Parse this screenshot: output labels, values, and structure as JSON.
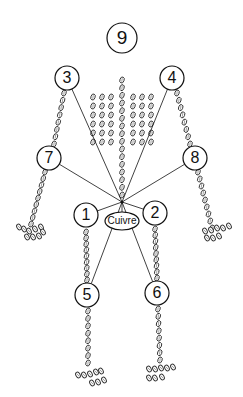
{
  "diagram": {
    "title": "",
    "center_label": "Cuivre",
    "hub": {
      "x": 122,
      "y": 202
    },
    "nodes": [
      {
        "id": "9",
        "label": "9",
        "x": 122,
        "y": 38,
        "r": 15,
        "connected": false
      },
      {
        "id": "3",
        "label": "3",
        "x": 67,
        "y": 78,
        "r": 12,
        "connected": true
      },
      {
        "id": "4",
        "label": "4",
        "x": 172,
        "y": 78,
        "r": 12,
        "connected": true
      },
      {
        "id": "7",
        "label": "7",
        "x": 49,
        "y": 158,
        "r": 12,
        "connected": true
      },
      {
        "id": "8",
        "label": "8",
        "x": 195,
        "y": 158,
        "r": 12,
        "connected": true
      },
      {
        "id": "1",
        "label": "1",
        "x": 86,
        "y": 215,
        "r": 12,
        "connected": true
      },
      {
        "id": "2",
        "label": "2",
        "x": 155,
        "y": 213,
        "r": 12,
        "connected": true
      },
      {
        "id": "5",
        "label": "5",
        "x": 87,
        "y": 295,
        "r": 12,
        "connected": true
      },
      {
        "id": "6",
        "label": "6",
        "x": 157,
        "y": 293,
        "r": 12,
        "connected": true
      }
    ],
    "center_node": {
      "label": "Cuivre",
      "x": 122,
      "y": 221,
      "rx": 17,
      "ry": 9
    },
    "colors": {
      "stroke": "#111111",
      "bead_fill": "#ffffff",
      "background": "#ffffff"
    }
  }
}
